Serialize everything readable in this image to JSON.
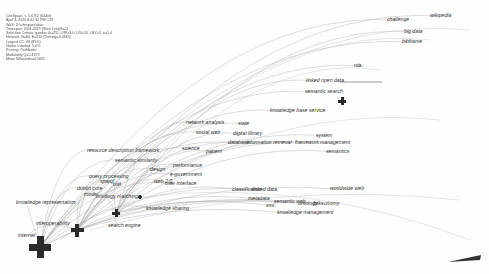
{
  "legend": {
    "lines": [
      "CiteSpace, v. 5.6.R2 (64-bit)",
      "April 3, 2020 8:41:32 PM CST",
      "WoS: D:\\citespace\\data",
      "Timespan: 2001-2019 (Slice Length=1)",
      "Selection Criteria: g-index (k=25), LRF=3.0, L/N=10, LBY=5, e=1.0",
      "Network: N=80, E=210 (Density=0.0665)",
      "Largest CC: 68 (85%)",
      "Nodes Labeled: 5.0%",
      "Pruning: Pathfinder",
      "Modularity Q=0.4379",
      "Mean Silhouette=0.5665"
    ]
  },
  "nodes": [
    {
      "id": "internet",
      "label": "internet",
      "x": 40,
      "y": 247,
      "size": 22,
      "lx": 18,
      "ly": 233
    },
    {
      "id": "interoperability",
      "label": "interoperability",
      "x": 77,
      "y": 230,
      "size": 13,
      "lx": 36,
      "ly": 221
    },
    {
      "id": "search",
      "label": "search",
      "x": 116,
      "y": 213,
      "size": 8,
      "lx": 90,
      "ly": 206
    },
    {
      "id": "semantic-search",
      "label": "semantic search",
      "x": 342,
      "y": 101,
      "size": 8,
      "lx": 305,
      "ly": 89
    },
    {
      "id": "evaluation",
      "label": "evaluation",
      "x": 140,
      "y": 197,
      "size": 4,
      "lx": 120,
      "ly": 200
    }
  ],
  "labels": [
    {
      "text": "challenge",
      "x": 387,
      "y": 17
    },
    {
      "text": "wikipedia",
      "x": 430,
      "y": 13
    },
    {
      "text": "big data",
      "x": 404,
      "y": 29
    },
    {
      "text": "bibframe",
      "x": 402,
      "y": 39
    },
    {
      "text": "rda",
      "x": 354,
      "y": 63
    },
    {
      "text": "linked open data",
      "x": 306,
      "y": 78
    },
    {
      "text": "semantic search",
      "x": 305,
      "y": 89
    },
    {
      "text": "knowledge base service",
      "x": 270,
      "y": 108
    },
    {
      "text": "network analysis",
      "x": 186,
      "y": 120
    },
    {
      "text": "state",
      "x": 238,
      "y": 121
    },
    {
      "text": "social web",
      "x": 196,
      "y": 130
    },
    {
      "text": "digital library",
      "x": 233,
      "y": 131
    },
    {
      "text": "database",
      "x": 228,
      "y": 140
    },
    {
      "text": "information retrieval",
      "x": 246,
      "y": 140
    },
    {
      "text": "framework",
      "x": 295,
      "y": 140
    },
    {
      "text": "management",
      "x": 320,
      "y": 140
    },
    {
      "text": "system",
      "x": 316,
      "y": 133
    },
    {
      "text": "semantics",
      "x": 326,
      "y": 149
    },
    {
      "text": "resource description framework",
      "x": 87,
      "y": 148
    },
    {
      "text": "science",
      "x": 182,
      "y": 146
    },
    {
      "text": "pattern",
      "x": 206,
      "y": 149
    },
    {
      "text": "semantic similarity",
      "x": 115,
      "y": 158
    },
    {
      "text": "design",
      "x": 150,
      "y": 167
    },
    {
      "text": "performance",
      "x": 173,
      "y": 163
    },
    {
      "text": "query processing",
      "x": 89,
      "y": 174
    },
    {
      "text": "e-government",
      "x": 170,
      "y": 172
    },
    {
      "text": "web 2.0",
      "x": 154,
      "y": 179
    },
    {
      "text": "user interface",
      "x": 165,
      "y": 181
    },
    {
      "text": "sparql",
      "x": 100,
      "y": 179
    },
    {
      "text": "owl",
      "x": 113,
      "y": 182
    },
    {
      "text": "dublin core",
      "x": 77,
      "y": 186
    },
    {
      "text": "model",
      "x": 84,
      "y": 192
    },
    {
      "text": "ontology matching",
      "x": 96,
      "y": 194
    },
    {
      "text": "knowledge representation",
      "x": 16,
      "y": 200
    },
    {
      "text": "knowledge sharing",
      "x": 146,
      "y": 206
    },
    {
      "text": "classification",
      "x": 232,
      "y": 187
    },
    {
      "text": "linked data",
      "x": 252,
      "y": 187
    },
    {
      "text": "metadata",
      "x": 248,
      "y": 196
    },
    {
      "text": "xml",
      "x": 266,
      "y": 203
    },
    {
      "text": "semantic web",
      "x": 274,
      "y": 199
    },
    {
      "text": "ontology",
      "x": 298,
      "y": 201
    },
    {
      "text": "folksonomy",
      "x": 313,
      "y": 201
    },
    {
      "text": "worldwide web",
      "x": 330,
      "y": 186
    },
    {
      "text": "knowledge management",
      "x": 277,
      "y": 210
    },
    {
      "text": "search engine",
      "x": 108,
      "y": 223
    },
    {
      "text": "interoperability",
      "x": 36,
      "y": 221
    },
    {
      "text": "internet",
      "x": 18,
      "y": 233
    }
  ],
  "colors": {
    "edge": "#9a9a9a",
    "node": "#2a2a2a",
    "label": "#333333",
    "bg": "#fefefe"
  }
}
